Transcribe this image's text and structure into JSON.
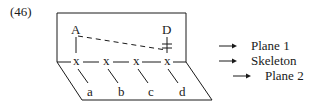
{
  "example_number": "(46)",
  "nodes": {
    "top": [
      {
        "label": "A"
      },
      {
        "label": "D"
      }
    ],
    "skeleton": [
      "x",
      "x",
      "x",
      "x"
    ],
    "bottom": [
      "a",
      "b",
      "c",
      "d"
    ]
  },
  "legend": [
    {
      "label": "Plane 1",
      "arrow": "→"
    },
    {
      "label": "Skeleton",
      "arrow": "→"
    },
    {
      "label": "Plane 2",
      "arrow": "→"
    }
  ],
  "colors": {
    "line": "#1a1a1a",
    "background": "#ffffff"
  }
}
